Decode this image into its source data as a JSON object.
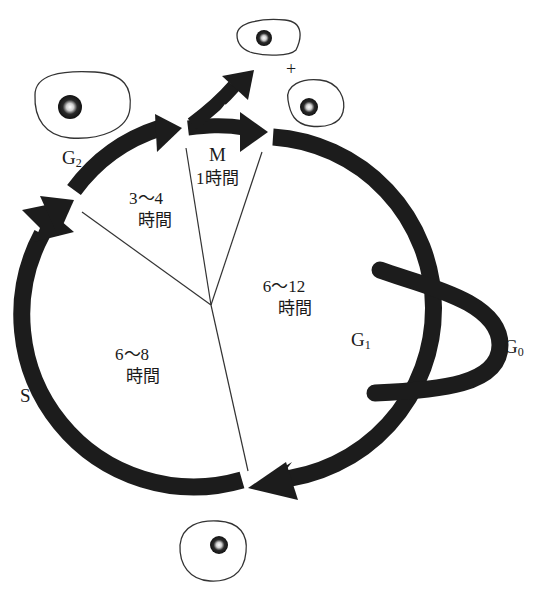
{
  "diagram": {
    "type": "cell-cycle",
    "colors": {
      "arrow": "#1c1c1c",
      "line": "#333333",
      "cell_outline": "#333333",
      "nucleus": "#1a1a1a",
      "background": "#ffffff"
    },
    "phases": {
      "g1": {
        "label": "G",
        "sub": "1",
        "duration_value": "6〜12",
        "duration_unit": "時間"
      },
      "s": {
        "label": "S",
        "sub": "",
        "duration_value": "6〜8",
        "duration_unit": "時間"
      },
      "g2": {
        "label": "G",
        "sub": "2",
        "duration_value": "3〜4",
        "duration_unit": "時間"
      },
      "m": {
        "label": "M",
        "sub": "",
        "duration_value": "1時間",
        "duration_unit": ""
      },
      "g0": {
        "label": "G",
        "sub": "0"
      }
    },
    "plus_sign": "+",
    "cells": [
      {
        "id": "g2-cell",
        "description": "cell before mitosis (G2)"
      },
      {
        "id": "daughter-cell-1",
        "description": "daughter cell after division"
      },
      {
        "id": "daughter-cell-2",
        "description": "daughter cell after division"
      },
      {
        "id": "g1-cell",
        "description": "cell entering S phase"
      }
    ]
  }
}
